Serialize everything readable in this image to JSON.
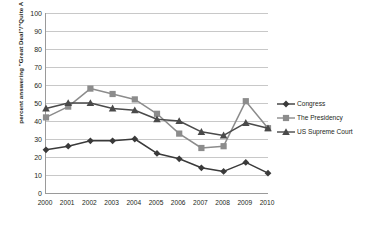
{
  "chart_data": {
    "type": "line",
    "title": "",
    "xlabel": "",
    "ylabel": "percent answering \"Great Deal\"/\"Quite A Lot\"",
    "categories": [
      "2000",
      "2001",
      "2002",
      "2003",
      "2004",
      "2005",
      "2006",
      "2007",
      "2008",
      "2009",
      "2010"
    ],
    "x": [
      2000,
      2001,
      2002,
      2003,
      2004,
      2005,
      2006,
      2007,
      2008,
      2009,
      2010
    ],
    "ylim": [
      0,
      100
    ],
    "xlim": [
      2000,
      2010
    ],
    "y_ticks": [
      0,
      10,
      20,
      30,
      40,
      50,
      60,
      70,
      80,
      90,
      100
    ],
    "grid": true,
    "legend_position": "right",
    "series": [
      {
        "name": "Congress",
        "color": "#3a3a3a",
        "marker": "diamond",
        "values": [
          24,
          26,
          29,
          29,
          30,
          22,
          19,
          14,
          12,
          17,
          11
        ]
      },
      {
        "name": "The Presidency",
        "color": "#8c8c8c",
        "marker": "square",
        "values": [
          42,
          48,
          58,
          55,
          52,
          44,
          33,
          25,
          26,
          51,
          36
        ]
      },
      {
        "name": "US Supreme Court",
        "color": "#4a4a4a",
        "marker": "triangle",
        "values": [
          47,
          50,
          50,
          47,
          46,
          41,
          40,
          34,
          32,
          39,
          36
        ]
      }
    ]
  },
  "legend": {
    "items": [
      {
        "label": "Congress"
      },
      {
        "label": "The Presidency"
      },
      {
        "label": "US Supreme Court"
      }
    ]
  },
  "axes": {
    "y_title": "percent answering \"Great Deal\"/\"Quite A Lot\""
  },
  "colors": {
    "congress": "#3a3a3a",
    "presidency": "#8c8c8c",
    "supreme_court": "#4a4a4a",
    "gridline": "#c8c8c8",
    "axis": "#9a9a9a",
    "text": "#231f20",
    "background": "#ffffff"
  }
}
